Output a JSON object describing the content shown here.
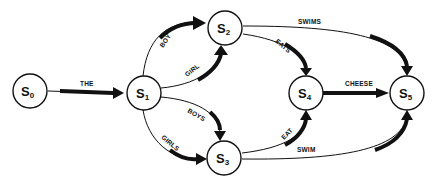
{
  "diagram": {
    "type": "state-transition-network",
    "nodes": [
      {
        "id": "S0",
        "base": "S",
        "sub": "0"
      },
      {
        "id": "S1",
        "base": "S",
        "sub": "1"
      },
      {
        "id": "S2",
        "base": "S",
        "sub": "2"
      },
      {
        "id": "S3",
        "base": "S",
        "sub": "3"
      },
      {
        "id": "S4",
        "base": "S",
        "sub": "4"
      },
      {
        "id": "S5",
        "base": "S",
        "sub": "5"
      }
    ],
    "edges": [
      {
        "from": "S0",
        "to": "S1",
        "label": "THE"
      },
      {
        "from": "S1",
        "to": "S2",
        "label": "BOY"
      },
      {
        "from": "S1",
        "to": "S2",
        "label": "GIRL"
      },
      {
        "from": "S1",
        "to": "S3",
        "label": "BOYS"
      },
      {
        "from": "S1",
        "to": "S3",
        "label": "GIRLS"
      },
      {
        "from": "S2",
        "to": "S4",
        "label": "EATS"
      },
      {
        "from": "S2",
        "to": "S5",
        "label": "SWIMS"
      },
      {
        "from": "S3",
        "to": "S4",
        "label": "EAT"
      },
      {
        "from": "S3",
        "to": "S5",
        "label": "SWIM"
      },
      {
        "from": "S4",
        "to": "S5",
        "label": "CHEESE"
      }
    ]
  }
}
